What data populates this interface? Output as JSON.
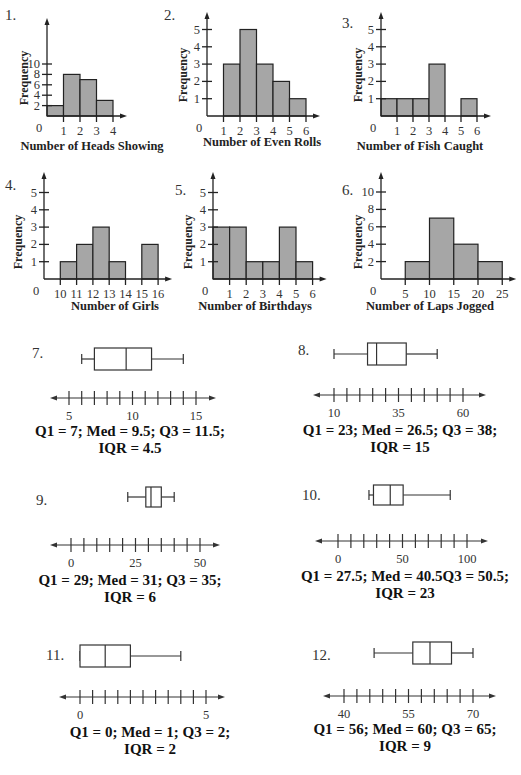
{
  "colors": {
    "bar_fill": "#a6a6a6",
    "stroke": "#222222"
  },
  "chart_data": [
    {
      "id": "1",
      "type": "bar",
      "title": "",
      "xlabel": "Number of Heads Showing",
      "ylabel": "Frequency",
      "bin_edges": [
        0,
        1,
        2,
        3,
        4
      ],
      "values": [
        2,
        8,
        7,
        3
      ],
      "x_ticks": [
        "0",
        "1",
        "2",
        "3",
        "4"
      ],
      "y_ticks": [
        "2",
        "4",
        "6",
        "8",
        "10"
      ],
      "ylim": [
        0,
        11
      ]
    },
    {
      "id": "2",
      "type": "bar",
      "xlabel": "Number of Even Rolls",
      "ylabel": "Frequency",
      "bin_edges": [
        1,
        2,
        3,
        4,
        5,
        6
      ],
      "values": [
        3,
        5,
        3,
        2,
        1
      ],
      "x_ticks": [
        "0",
        "1",
        "2",
        "3",
        "4",
        "5",
        "6"
      ],
      "y_ticks": [
        "1",
        "2",
        "3",
        "4",
        "5"
      ],
      "ylim": [
        0,
        5.5
      ]
    },
    {
      "id": "3",
      "type": "bar",
      "xlabel": "Number of Fish Caught",
      "ylabel": "Frequency",
      "bin_edges": [
        0,
        1,
        2,
        3,
        4,
        5,
        6
      ],
      "values": [
        1,
        1,
        1,
        3,
        0,
        1
      ],
      "x_ticks": [
        "0",
        "1",
        "2",
        "3",
        "4",
        "5",
        "6"
      ],
      "y_ticks": [
        "1",
        "2",
        "3",
        "4",
        "5"
      ],
      "ylim": [
        0,
        5.5
      ]
    },
    {
      "id": "4",
      "type": "bar",
      "xlabel": "Number of Girls",
      "ylabel": "Frequency",
      "bin_edges": [
        10,
        11,
        12,
        13,
        14,
        15,
        16
      ],
      "values": [
        1,
        2,
        3,
        1,
        0,
        2
      ],
      "x_ticks": [
        "0",
        "10",
        "11",
        "12",
        "13",
        "14",
        "15",
        "16"
      ],
      "y_ticks": [
        "1",
        "2",
        "3",
        "4",
        "5"
      ],
      "ylim": [
        0,
        5.5
      ]
    },
    {
      "id": "5",
      "type": "bar",
      "xlabel": "Number of Birthdays",
      "ylabel": "Frequency",
      "bin_edges": [
        0,
        1,
        2,
        3,
        4,
        5,
        6
      ],
      "values": [
        3,
        3,
        1,
        1,
        3,
        1
      ],
      "x_ticks": [
        "0",
        "1",
        "2",
        "3",
        "4",
        "5",
        "6"
      ],
      "y_ticks": [
        "1",
        "2",
        "3",
        "4",
        "5"
      ],
      "ylim": [
        0,
        5.5
      ]
    },
    {
      "id": "6",
      "type": "bar",
      "xlabel": "Number of Laps Jogged",
      "ylabel": "Frequency",
      "bin_edges": [
        5,
        10,
        15,
        20,
        25
      ],
      "values": [
        2,
        7,
        4,
        2
      ],
      "x_ticks": [
        "0",
        "5",
        "10",
        "15",
        "20",
        "25"
      ],
      "y_ticks": [
        "2",
        "4",
        "6",
        "8",
        "10"
      ],
      "ylim": [
        0,
        11
      ]
    },
    {
      "id": "7",
      "type": "box",
      "min": 6,
      "q1": 7,
      "median": 9.5,
      "q3": 11.5,
      "max": 14,
      "axis": {
        "start": 5,
        "end": 15,
        "step": 1,
        "labels": [
          "5",
          "10",
          "15"
        ]
      },
      "stats_line1": "Q1 = 7;  Med = 9.5;  Q3 = 11.5;",
      "stats_line2": "IQR = 4.5"
    },
    {
      "id": "8",
      "type": "box",
      "min": 10,
      "q1": 23,
      "median": 26.5,
      "q3": 38,
      "max": 50,
      "axis": {
        "start": 10,
        "end": 60,
        "step": 5,
        "labels": [
          "10",
          "35",
          "60"
        ]
      },
      "stats_line1": "Q1 = 23;  Med = 26.5;  Q3 = 38;",
      "stats_line2": "IQR = 15"
    },
    {
      "id": "9",
      "type": "box",
      "min": 22,
      "q1": 29,
      "median": 31,
      "q3": 35,
      "max": 40,
      "axis": {
        "start": 0,
        "end": 50,
        "step": 5,
        "labels": [
          "0",
          "25",
          "50"
        ]
      },
      "stats_line1": "Q1 = 29;  Med = 31;  Q3 = 35;",
      "stats_line2": "IQR = 6"
    },
    {
      "id": "10",
      "type": "box",
      "min": 24,
      "q1": 27.5,
      "median": 40.5,
      "q3": 50.5,
      "max": 87,
      "axis": {
        "start": 0,
        "end": 100,
        "step": 10,
        "labels": [
          "0",
          "50",
          "100"
        ]
      },
      "stats_line1": "Q1 = 27.5;  Med = 40.5Q3 = 50.5;",
      "stats_line2": "IQR = 23"
    },
    {
      "id": "11",
      "type": "box",
      "min": 0,
      "q1": 0,
      "median": 1,
      "q3": 2,
      "max": 4,
      "axis": {
        "start": 0,
        "end": 5,
        "step": 0.5,
        "labels": [
          "0",
          "5"
        ]
      },
      "stats_line1": "Q1 = 0;  Med = 1;  Q3 = 2;",
      "stats_line2": "IQR = 2"
    },
    {
      "id": "12",
      "type": "box",
      "min": 47,
      "q1": 56,
      "median": 60,
      "q3": 65,
      "max": 70,
      "axis": {
        "start": 40,
        "end": 70,
        "step": 3,
        "labels": [
          "40",
          "55",
          "70"
        ]
      },
      "stats_line1": "Q1 = 56;  Med = 60;  Q3 = 65;",
      "stats_line2": "IQR = 9"
    }
  ],
  "labels": {
    "n1": "1.",
    "n2": "2.",
    "n3": "3.",
    "n4": "4.",
    "n5": "5.",
    "n6": "6.",
    "n7": "7.",
    "n8": "8.",
    "n9": "9.",
    "n10": "10.",
    "n11": "11.",
    "n12": "12.",
    "freq": "Frequency"
  }
}
